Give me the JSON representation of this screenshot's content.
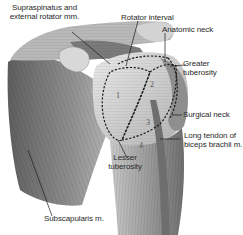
{
  "figure": {
    "labels": {
      "supraspinatus_line1": "Supraspinatus and",
      "supraspinatus_line2": "external rotator mm.",
      "rotator_interval": "Rotator interval",
      "anatomic_neck": "Anatomic neck",
      "greater_tuberosity_line1": "Greater",
      "greater_tuberosity_line2": "tuberosity",
      "surgical_neck": "Surgical neck",
      "long_tendon_line1": "Long tendon of",
      "long_tendon_line2": "biceps brachii m.",
      "lesser_tuberosity_line1": "Lesser",
      "lesser_tuberosity_line2": "tuberosity",
      "subscapularis": "Subscapularis m."
    },
    "region_numbers": [
      "1",
      "2",
      "3",
      "4"
    ],
    "colors": {
      "background": "#ffffff",
      "muscle_dark": "#6b6b6b",
      "muscle_mid": "#9a9a9a",
      "muscle_light": "#cfcfcf",
      "bone": "#dedede",
      "leader_line": "#1a1a1a",
      "dashed_outline": "#1a1a1a"
    }
  }
}
